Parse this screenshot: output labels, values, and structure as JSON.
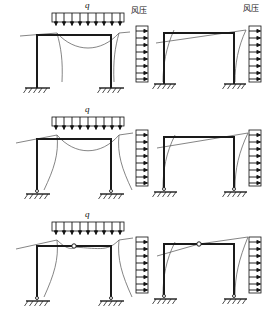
{
  "figure": {
    "rows": [
      {
        "id": "row-fixed",
        "support_type": "fixed",
        "has_mid_hinge": false,
        "left_panel": {
          "load_label": "q",
          "load_type": "uniform-vertical",
          "arrow_count": 9
        },
        "right_panel": {
          "load_type": "wind-pressure",
          "left_label": "风压",
          "right_label": "风压",
          "arrow_count": 8,
          "show_labels": true
        }
      },
      {
        "id": "row-pinned",
        "support_type": "pinned",
        "has_mid_hinge": false,
        "left_panel": {
          "load_label": "q",
          "load_type": "uniform-vertical",
          "arrow_count": 9
        },
        "right_panel": {
          "load_type": "wind-pressure",
          "left_label": "",
          "right_label": "",
          "arrow_count": 8,
          "show_labels": false
        }
      },
      {
        "id": "row-pinned-hinge",
        "support_type": "pinned",
        "has_mid_hinge": true,
        "left_panel": {
          "load_label": "q",
          "load_type": "uniform-vertical",
          "arrow_count": 9
        },
        "right_panel": {
          "load_type": "wind-pressure",
          "left_label": "",
          "right_label": "",
          "arrow_count": 8,
          "show_labels": false
        }
      }
    ],
    "colors": {
      "frame": "#1a1a1a",
      "deflection": "#555555",
      "load": "#111111",
      "ground": "#222222"
    }
  }
}
